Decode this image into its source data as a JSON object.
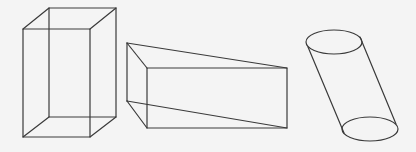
{
  "figure": {
    "background": "#f4f4f4",
    "stroke_color": "#3a3a3a",
    "shapes": [
      {
        "name": "rectangular-prism",
        "type": "cuboid",
        "front_face": {
          "x1": 23,
          "y1": 29,
          "x2": 90,
          "y2": 137
        },
        "back_face": {
          "x1": 49,
          "y1": 8,
          "x2": 116,
          "y2": 117
        }
      },
      {
        "name": "triangular-prism",
        "type": "wedge",
        "back_edge": {
          "x": 127,
          "y1": 43,
          "y2": 101
        },
        "front_face": {
          "x1": 147,
          "y1": 68,
          "x2": 287,
          "y2": 128
        }
      },
      {
        "name": "oblique-cylinder",
        "type": "cylinder",
        "top_ellipse": {
          "cx": 334,
          "cy": 42,
          "rx": 28,
          "ry": 12
        },
        "bottom_ellipse": {
          "cx": 370,
          "cy": 129,
          "rx": 28,
          "ry": 12
        }
      }
    ]
  }
}
